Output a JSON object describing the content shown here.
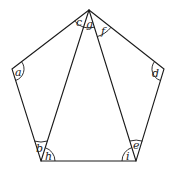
{
  "diagram": {
    "type": "regular-pentagon-with-diagonals",
    "colors": {
      "stroke": "#1a1a1a",
      "background": "#ffffff"
    },
    "vertices": {
      "top": [
        89,
        10
      ],
      "left": [
        12,
        69
      ],
      "right": [
        164,
        69
      ],
      "bottom_left": [
        41,
        161
      ],
      "bottom_right": [
        136,
        161
      ]
    },
    "angle_labels": {
      "a": "a",
      "b": "b",
      "c": "c",
      "d": "d",
      "e": "e",
      "f": "f",
      "g": "g",
      "h": "h",
      "i": "i"
    }
  }
}
